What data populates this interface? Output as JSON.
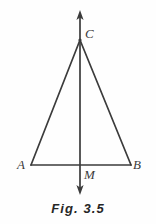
{
  "figure": {
    "caption": "Fig. 3.5",
    "background_color": "#fefefe",
    "stroke_color": "#3b3b3b",
    "label_color": "#3b3b3b",
    "caption_color": "#262626"
  },
  "labels": {
    "apex": "C",
    "left_vertex": "A",
    "right_vertex": "B",
    "midpoint": "M"
  },
  "geometry": {
    "points": {
      "C": {
        "x": 80,
        "y": 40
      },
      "A": {
        "x": 31,
        "y": 165
      },
      "B": {
        "x": 131,
        "y": 165
      },
      "M": {
        "x": 80,
        "y": 165
      }
    },
    "axis_line": {
      "top_y": 12,
      "bottom_y": 194,
      "x_top": 80,
      "x_bottom": 80,
      "arrow_top": true,
      "arrow_bottom": true
    },
    "stroke_width": 1.7
  }
}
